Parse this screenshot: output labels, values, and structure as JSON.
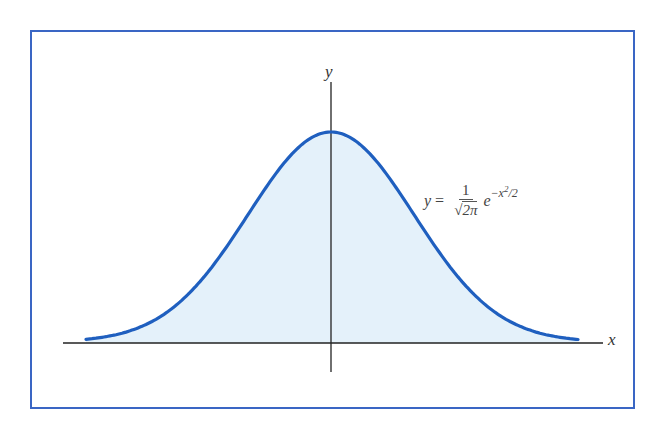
{
  "figure": {
    "frame_color": "#3a66c4",
    "curve_color": "#1f5fbf",
    "fill_color": "#e4f1fa",
    "axis_color": "#222222"
  },
  "axes": {
    "x_label": "x",
    "y_label": "y"
  },
  "formula": {
    "lhs": "y",
    "equals": "=",
    "numerator": "1",
    "denominator_radical": "2π",
    "base": "e",
    "exponent": "−x",
    "exponent_power": "2",
    "exponent_tail": "/2"
  },
  "chart_data": {
    "type": "line",
    "title": "",
    "equation": "y = 1/√(2π) · e^(−x²/2)",
    "xlabel": "x",
    "ylabel": "y",
    "xlim": [
      -3,
      3
    ],
    "series": [
      {
        "name": "standard normal density",
        "x": [
          -3.0,
          -2.5,
          -2.0,
          -1.5,
          -1.0,
          -0.5,
          0.0,
          0.5,
          1.0,
          1.5,
          2.0,
          2.5,
          3.0
        ],
        "values": [
          0.0044,
          0.0175,
          0.054,
          0.1295,
          0.242,
          0.3521,
          0.3989,
          0.3521,
          0.242,
          0.1295,
          0.054,
          0.0175,
          0.0044
        ]
      }
    ],
    "grid": false,
    "legend": null,
    "shaded_area": "under curve"
  }
}
